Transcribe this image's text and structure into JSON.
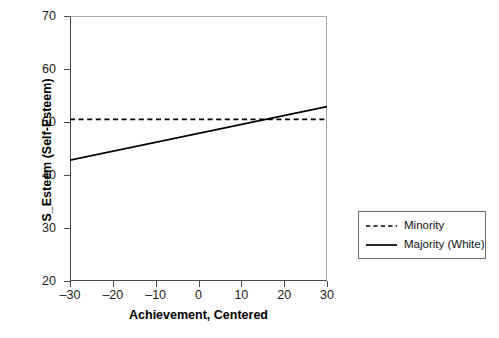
{
  "chart_data": {
    "type": "line",
    "title": "",
    "xlabel": "Achievement, Centered",
    "ylabel": "S_Esteem (Self-Esteem)",
    "xlim": [
      -30,
      30
    ],
    "ylim": [
      20,
      70
    ],
    "xticks": [
      -30,
      -20,
      -10,
      0,
      10,
      20,
      30
    ],
    "xtick_labels": [
      "–30",
      "–20",
      "–10",
      "0",
      "10",
      "20",
      "30"
    ],
    "yticks": [
      20,
      30,
      40,
      50,
      60,
      70
    ],
    "ytick_labels": [
      "20",
      "30",
      "40",
      "50",
      "60",
      "70"
    ],
    "grid": false,
    "legend_position": "right-outside",
    "series": [
      {
        "name": "Minority",
        "style": "dashed",
        "color": "#000000",
        "x": [
          -30,
          30
        ],
        "values": [
          50.5,
          50.5
        ]
      },
      {
        "name": "Majority (White)",
        "style": "solid",
        "color": "#000000",
        "x": [
          -30,
          30
        ],
        "values": [
          42.8,
          52.9
        ]
      }
    ],
    "annotations": []
  },
  "legend": {
    "items": [
      {
        "label": "Minority",
        "style": "dashed"
      },
      {
        "label": "Majority (White)",
        "style": "solid"
      }
    ]
  }
}
